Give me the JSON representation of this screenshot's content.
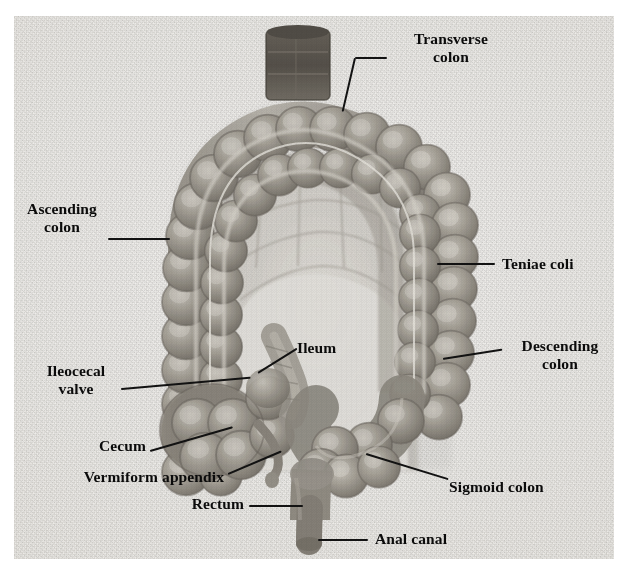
{
  "figure": {
    "background_color": "#eceae6",
    "label_color": "#0b0b0b",
    "tissue_color": "#8f8b82",
    "lumen_color": "#e9e7e2"
  },
  "labels": [
    {
      "id": "transverse-colon",
      "text": "Transverse colon",
      "lines": [
        "Transverse",
        "colon"
      ]
    },
    {
      "id": "ascending-colon",
      "text": "Ascending colon",
      "lines": [
        "Ascending",
        "colon"
      ]
    },
    {
      "id": "teniae-coli",
      "text": "Teniae coli",
      "lines": [
        "Teniae coli"
      ]
    },
    {
      "id": "descending-colon",
      "text": "Descending colon",
      "lines": [
        "Descending",
        "colon"
      ]
    },
    {
      "id": "ileum",
      "text": "Ileum",
      "lines": [
        "Ileum"
      ]
    },
    {
      "id": "ileocecal-valve",
      "text": "Ileocecal valve",
      "lines": [
        "Ileocecal",
        "valve"
      ]
    },
    {
      "id": "cecum",
      "text": "Cecum",
      "lines": [
        "Cecum"
      ]
    },
    {
      "id": "vermiform-appendix",
      "text": "Vermiform appendix",
      "lines": [
        "Vermiform appendix"
      ]
    },
    {
      "id": "sigmoid-colon",
      "text": "Sigmoid colon",
      "lines": [
        "Sigmoid colon"
      ]
    },
    {
      "id": "rectum",
      "text": "Rectum",
      "lines": [
        "Rectum"
      ]
    },
    {
      "id": "anal-canal",
      "text": "Anal canal",
      "lines": [
        "Anal canal"
      ]
    }
  ],
  "label_text": {
    "transverse_colon_1": "Transverse",
    "transverse_colon_2": "colon",
    "ascending_colon_1": "Ascending",
    "ascending_colon_2": "colon",
    "teniae_coli": "Teniae coli",
    "descending_colon_1": "Descending",
    "descending_colon_2": "colon",
    "ileum": "Ileum",
    "ileocecal_valve_1": "Ileocecal",
    "ileocecal_valve_2": "valve",
    "cecum": "Cecum",
    "vermiform_appendix": "Vermiform appendix",
    "sigmoid_colon": "Sigmoid colon",
    "rectum": "Rectum",
    "anal_canal": "Anal canal"
  }
}
